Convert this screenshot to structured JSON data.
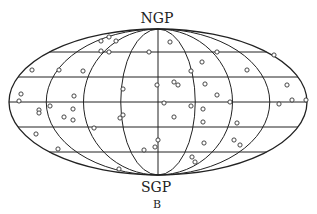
{
  "figure": {
    "projection": "Mollweide-style all-sky (galactic coordinates)",
    "top_label": "NGP",
    "bottom_label": "SGP",
    "panel_label": "B",
    "colors": {
      "line": "#222222",
      "marker_stroke": "#333333",
      "background": "#ffffff"
    }
  },
  "geometry": {
    "cx": 158,
    "cy": 102,
    "rx": 149,
    "ry": 73,
    "meridian_rx": [
      37.25,
      74.5,
      111.75,
      149
    ],
    "parallel_y": [
      52,
      77,
      102,
      127,
      152
    ]
  },
  "points": [
    [
      32,
      70
    ],
    [
      59,
      70
    ],
    [
      83,
      71
    ],
    [
      101,
      41
    ],
    [
      109,
      37
    ],
    [
      116,
      41
    ],
    [
      101,
      51
    ],
    [
      109,
      52
    ],
    [
      149,
      52
    ],
    [
      21,
      94
    ],
    [
      19,
      101
    ],
    [
      123,
      89
    ],
    [
      157,
      85
    ],
    [
      74,
      96
    ],
    [
      170,
      42
    ],
    [
      217,
      52
    ],
    [
      202,
      62
    ],
    [
      191,
      71
    ],
    [
      247,
      70
    ],
    [
      274,
      55
    ],
    [
      174,
      82
    ],
    [
      178,
      85
    ],
    [
      205,
      84
    ],
    [
      217,
      95
    ],
    [
      287,
      85
    ],
    [
      164,
      103
    ],
    [
      191,
      106
    ],
    [
      230,
      102
    ],
    [
      203,
      109
    ],
    [
      279,
      104
    ],
    [
      306,
      100
    ],
    [
      292,
      100
    ],
    [
      39,
      110
    ],
    [
      39,
      113
    ],
    [
      50,
      106
    ],
    [
      64,
      117
    ],
    [
      73,
      109
    ],
    [
      73,
      120
    ],
    [
      94,
      128
    ],
    [
      120,
      118
    ],
    [
      123,
      115
    ],
    [
      36,
      134
    ],
    [
      58,
      149
    ],
    [
      144,
      150
    ],
    [
      155,
      147
    ],
    [
      158,
      140
    ],
    [
      119,
      169
    ],
    [
      174,
      117
    ],
    [
      203,
      122
    ],
    [
      237,
      123
    ],
    [
      204,
      143
    ],
    [
      234,
      140
    ],
    [
      240,
      145
    ],
    [
      192,
      157
    ],
    [
      195,
      162
    ]
  ]
}
